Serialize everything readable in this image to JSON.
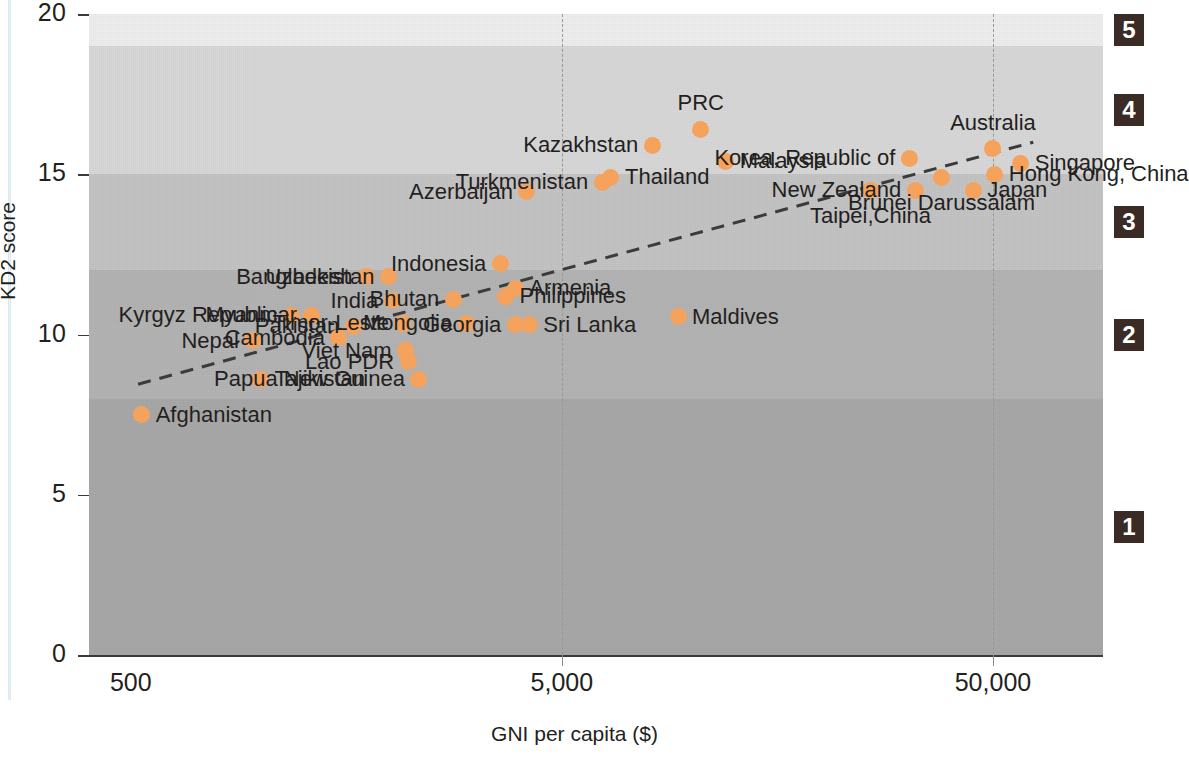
{
  "axes": {
    "y_title": "KD2 score",
    "x_title": "GNI per capita ($)",
    "y_ticks": [
      "0",
      "5",
      "10",
      "15",
      "20"
    ],
    "x_ticks": [
      "500",
      "5,000",
      "50,000"
    ]
  },
  "levels": [
    {
      "label": "1"
    },
    {
      "label": "2"
    },
    {
      "label": "3"
    },
    {
      "label": "4"
    },
    {
      "label": "5"
    }
  ],
  "chart_data": {
    "type": "scatter",
    "title": "",
    "xlabel": "GNI per capita ($)",
    "ylabel": "KD2 score",
    "xscale": "log",
    "xlim": [
      400,
      90000
    ],
    "ylim": [
      0,
      20
    ],
    "x_tick_values": [
      500,
      5000,
      50000
    ],
    "y_tick_values": [
      0,
      5,
      10,
      15,
      20
    ],
    "grid": "vertical dashed at x = 5,000 and 50,000",
    "marker_color": "#f5a25d",
    "band_boundaries_y": [
      0,
      8,
      12,
      15,
      19,
      20
    ],
    "band_labels": [
      "1",
      "2",
      "3",
      "4",
      "5"
    ],
    "band_colors": [
      "#a8a8a8",
      "#b4b4b4",
      "#c4c4c4",
      "#d8d8d8",
      "#eeeeee"
    ],
    "trendline": {
      "style": "dashed",
      "color": "#3b3b3b",
      "x_start": 520,
      "y_start": 8.45,
      "x_end": 62000,
      "y_end": 16.0
    },
    "points": [
      {
        "name": "Afghanistan",
        "gni": 530,
        "kd2": 7.5,
        "label_pos": "right"
      },
      {
        "name": "Tajikistan",
        "gni": 1000,
        "kd2": 8.6,
        "label_pos": "right"
      },
      {
        "name": "Nepal",
        "gni": 960,
        "kd2": 9.8,
        "label_pos": "left"
      },
      {
        "name": "Kyrgyz Republic",
        "gni": 1180,
        "kd2": 10.6,
        "label_pos": "left"
      },
      {
        "name": "Myanmar",
        "gni": 1310,
        "kd2": 10.6,
        "label_pos": "left"
      },
      {
        "name": "Cambodia",
        "gni": 1520,
        "kd2": 9.9,
        "label_pos": "left"
      },
      {
        "name": "Pakistan",
        "gni": 1640,
        "kd2": 10.25,
        "label_pos": "left"
      },
      {
        "name": "Bangladesh",
        "gni": 1760,
        "kd2": 11.8,
        "label_pos": "left"
      },
      {
        "name": "Uzbekistan",
        "gni": 1980,
        "kd2": 11.8,
        "label_pos": "left"
      },
      {
        "name": "India",
        "gni": 2020,
        "kd2": 11.05,
        "label_pos": "left"
      },
      {
        "name": "Timor-Leste",
        "gni": 2140,
        "kd2": 10.35,
        "label_pos": "left"
      },
      {
        "name": "Viet Nam",
        "gni": 2170,
        "kd2": 9.5,
        "label_pos": "left"
      },
      {
        "name": "Lao PDR",
        "gni": 2200,
        "kd2": 9.15,
        "label_pos": "left"
      },
      {
        "name": "Papua New Guinea",
        "gni": 2330,
        "kd2": 8.6,
        "label_pos": "left"
      },
      {
        "name": "Bhutan",
        "gni": 2800,
        "kd2": 11.1,
        "label_pos": "left"
      },
      {
        "name": "Mongolia",
        "gni": 3000,
        "kd2": 10.35,
        "label_pos": "left"
      },
      {
        "name": "Indonesia",
        "gni": 3600,
        "kd2": 12.2,
        "label_pos": "left"
      },
      {
        "name": "Philippines",
        "gni": 3700,
        "kd2": 11.2,
        "label_pos": "right"
      },
      {
        "name": "Armenia",
        "gni": 3900,
        "kd2": 11.45,
        "label_pos": "right"
      },
      {
        "name": "Georgia",
        "gni": 3900,
        "kd2": 10.3,
        "label_pos": "left"
      },
      {
        "name": "Sri Lanka",
        "gni": 4200,
        "kd2": 10.3,
        "label_pos": "right"
      },
      {
        "name": "Azerbaijan",
        "gni": 4150,
        "kd2": 14.45,
        "label_pos": "left"
      },
      {
        "name": "Turkmenistan",
        "gni": 6200,
        "kd2": 14.75,
        "label_pos": "left"
      },
      {
        "name": "Thailand",
        "gni": 6500,
        "kd2": 14.9,
        "label_pos": "right"
      },
      {
        "name": "Maldives",
        "gni": 9300,
        "kd2": 10.55,
        "label_pos": "right"
      },
      {
        "name": "Kazakhstan",
        "gni": 8100,
        "kd2": 15.9,
        "label_pos": "left"
      },
      {
        "name": "PRC",
        "gni": 10500,
        "kd2": 16.4,
        "label_pos": "above"
      },
      {
        "name": "Malaysia",
        "gni": 12000,
        "kd2": 15.4,
        "label_pos": "right"
      },
      {
        "name": "Taipei,China",
        "gni": 26000,
        "kd2": 14.5,
        "label_pos": "below"
      },
      {
        "name": "New Zealand",
        "gni": 33000,
        "kd2": 14.5,
        "label_pos": "left"
      },
      {
        "name": "Korea, Republic of",
        "gni": 32000,
        "kd2": 15.5,
        "label_pos": "left"
      },
      {
        "name": "Brunei Darussalam",
        "gni": 38000,
        "kd2": 14.9,
        "label_pos": "below"
      },
      {
        "name": "Japan",
        "gni": 45000,
        "kd2": 14.5,
        "label_pos": "right"
      },
      {
        "name": "Australia",
        "gni": 50000,
        "kd2": 15.8,
        "label_pos": "above"
      },
      {
        "name": "Hong Kong, China",
        "gni": 50500,
        "kd2": 15.0,
        "label_pos": "right"
      },
      {
        "name": "Singapore",
        "gni": 58000,
        "kd2": 15.35,
        "label_pos": "right"
      }
    ]
  }
}
